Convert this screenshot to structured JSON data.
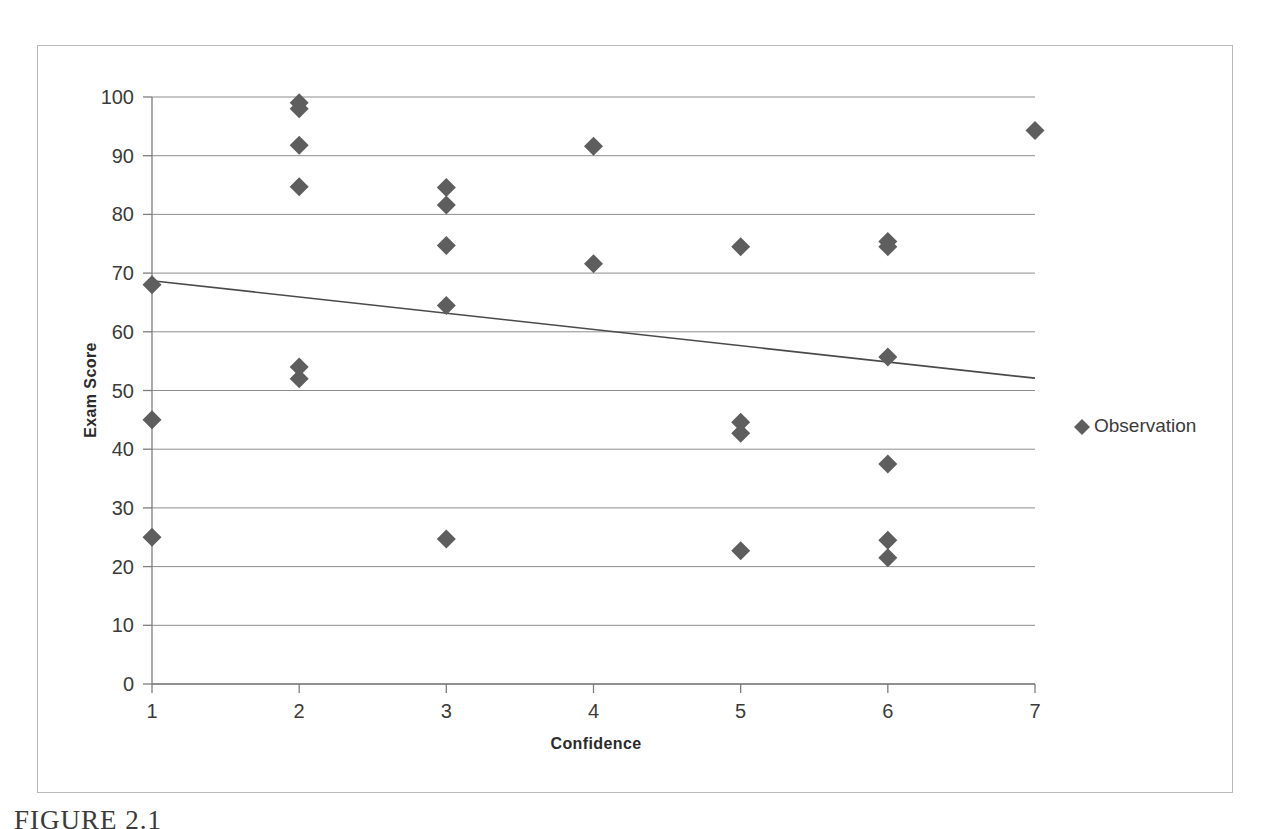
{
  "figure": {
    "caption": "FIGURE 2.1",
    "border_color": "#b9b9b9"
  },
  "legend": {
    "position": "right",
    "marker_glyph": "♦",
    "entries": [
      {
        "label": "Observation",
        "color": "#5e5e5e",
        "marker": "diamond"
      }
    ]
  },
  "chart_data": {
    "type": "scatter",
    "title": "",
    "xlabel": "Confidence",
    "ylabel": "Exam Score",
    "xlim": [
      1,
      7
    ],
    "ylim": [
      0,
      100
    ],
    "xticks": [
      1,
      2,
      3,
      4,
      5,
      6,
      7
    ],
    "yticks": [
      0,
      10,
      20,
      30,
      40,
      50,
      60,
      70,
      80,
      90,
      100
    ],
    "xtick_labels": [
      "1",
      "2",
      "3",
      "4",
      "5",
      "6",
      "7"
    ],
    "ytick_labels": [
      "0",
      "10",
      "20",
      "30",
      "40",
      "50",
      "60",
      "70",
      "80",
      "90",
      "100"
    ],
    "grid": "horizontal",
    "grid_color": "#8d8d8d",
    "marker_color": "#5e5e5e",
    "marker_shape": "diamond",
    "legend_position": "right",
    "series": [
      {
        "name": "Observation",
        "points": [
          {
            "x": 1,
            "y": 68
          },
          {
            "x": 1,
            "y": 45
          },
          {
            "x": 1,
            "y": 25
          },
          {
            "x": 2,
            "y": 99
          },
          {
            "x": 2,
            "y": 98
          },
          {
            "x": 2,
            "y": 91.8
          },
          {
            "x": 2,
            "y": 84.7
          },
          {
            "x": 2,
            "y": 54
          },
          {
            "x": 2,
            "y": 52
          },
          {
            "x": 3,
            "y": 84.6
          },
          {
            "x": 3,
            "y": 81.6
          },
          {
            "x": 3,
            "y": 74.7
          },
          {
            "x": 3,
            "y": 64.5
          },
          {
            "x": 3,
            "y": 24.7
          },
          {
            "x": 4,
            "y": 91.6
          },
          {
            "x": 4,
            "y": 71.6
          },
          {
            "x": 5,
            "y": 74.5
          },
          {
            "x": 5,
            "y": 44.6
          },
          {
            "x": 5,
            "y": 42.7
          },
          {
            "x": 5,
            "y": 22.7
          },
          {
            "x": 6,
            "y": 75.4
          },
          {
            "x": 6,
            "y": 74.5
          },
          {
            "x": 6,
            "y": 55.7
          },
          {
            "x": 6,
            "y": 37.5
          },
          {
            "x": 6,
            "y": 24.5
          },
          {
            "x": 6,
            "y": 21.5
          },
          {
            "x": 7,
            "y": 94.3
          }
        ]
      }
    ],
    "trendline": {
      "type": "linear",
      "color": "#4a4a4a",
      "x_start": 1,
      "y_start": 68.7,
      "x_end": 7,
      "y_end": 52.1
    }
  }
}
